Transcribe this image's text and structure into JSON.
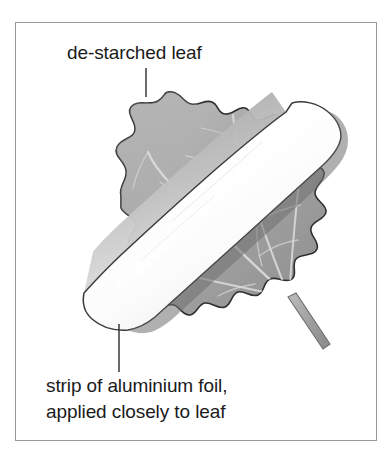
{
  "figure": {
    "title_alt": "de-starched leaf with strip of aluminium foil",
    "frame": {
      "border_color": "#9a9a9a",
      "background_color": "#ffffff"
    },
    "labels": {
      "top": "de-starched leaf",
      "bottom_line1": "strip of aluminium foil,",
      "bottom_line2": "applied closely to leaf"
    },
    "leader_lines": {
      "top": {
        "x": 146,
        "y_start": 68,
        "y_end": 97,
        "color": "#2b2b2b"
      },
      "bottom": {
        "x": 119,
        "y_start": 324,
        "y_end": 372,
        "color": "#2b2b2b"
      }
    },
    "elements": [
      {
        "name": "leaf-blade",
        "description": "de-starched lobed leaf, gray with lighter veins",
        "fill_light": "#b9b9b9",
        "fill_dark": "#8e8e8e",
        "outline_color": "#2f2f2f",
        "vein_color": "#d6d6d6"
      },
      {
        "name": "aluminium-foil-strip",
        "description": "white reflective band applied diagonally across the leaf",
        "fill_light": "#ffffff",
        "fill_shadow": "#c8c8c8",
        "outline_color": "#3a3a3a"
      },
      {
        "name": "leaf-stem",
        "description": "petiole extending from lower right of the blade",
        "fill": "#a8a8a8",
        "outline_color": "#6e6e6e"
      }
    ],
    "colors": {
      "text": "#1b1b1b",
      "frame_border": "#9a9a9a",
      "leaf_mid_gray": "#a5a5a5",
      "foil_white": "#ffffff",
      "stem_gray": "#a8a8a8"
    }
  }
}
